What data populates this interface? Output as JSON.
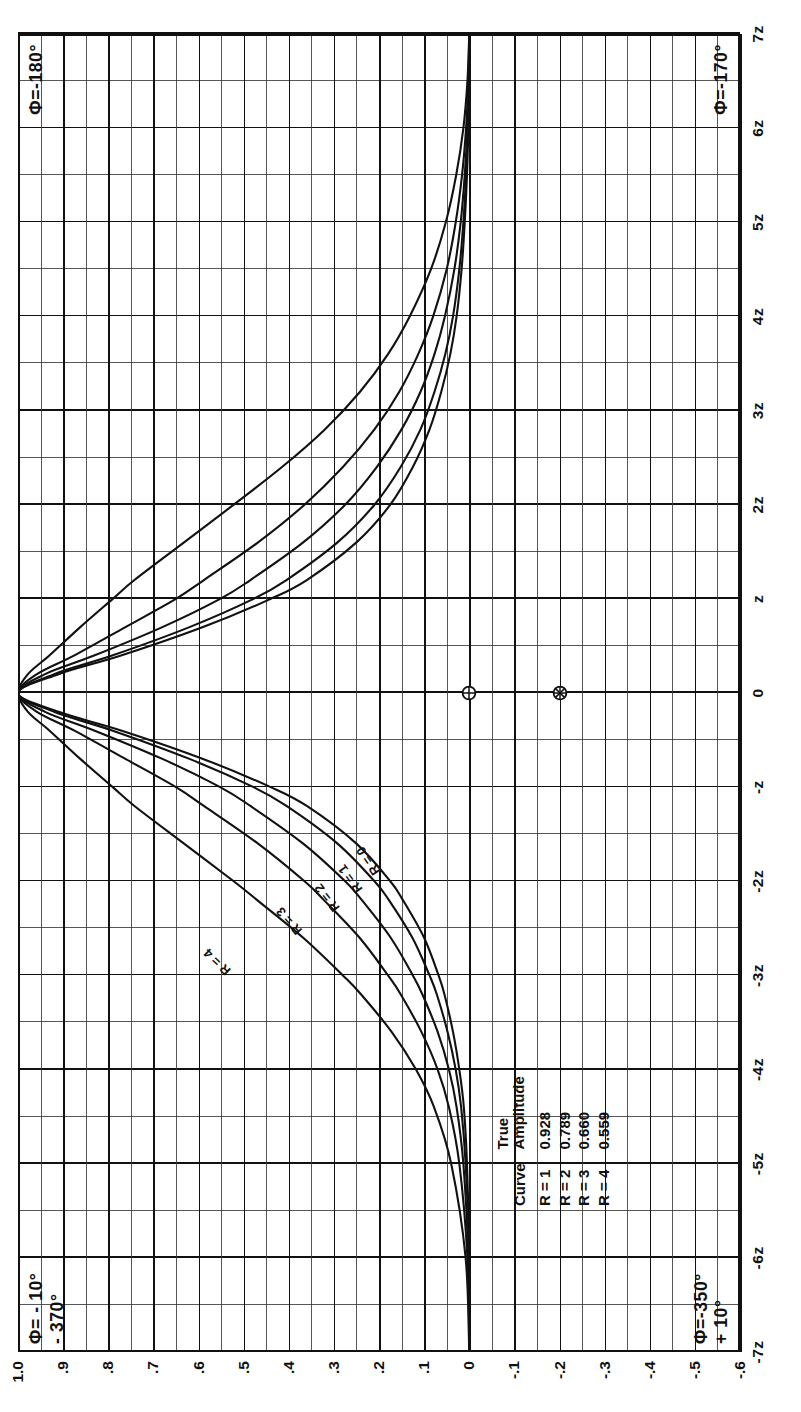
{
  "chart_data": {
    "type": "line",
    "title": "",
    "xlabel": "",
    "ylabel": "",
    "x_tick_labels": [
      "-7z",
      "-6z",
      "-5z",
      "-4z",
      "-3z",
      "-2z",
      "-z",
      "0",
      "z",
      "2z",
      "3z",
      "4z",
      "5z",
      "6z",
      "7z"
    ],
    "x_tick_values": [
      -7,
      -6,
      -5,
      -4,
      -3,
      -2,
      -1,
      0,
      1,
      2,
      3,
      4,
      5,
      6,
      7
    ],
    "y_tick_labels": [
      "1.0",
      ".9",
      ".8",
      ".7",
      ".6",
      ".5",
      ".4",
      ".3",
      ".2",
      ".1",
      "0",
      "-.1",
      "-.2",
      "-.3",
      "-.4",
      "-.5",
      "-.6"
    ],
    "y_tick_values": [
      1.0,
      0.9,
      0.8,
      0.7,
      0.6,
      0.5,
      0.4,
      0.3,
      0.2,
      0.1,
      0.0,
      -0.1,
      -0.2,
      -0.3,
      -0.4,
      -0.5,
      -0.6
    ],
    "xlim": [
      -7,
      7
    ],
    "ylim": [
      -0.6,
      1.0
    ],
    "grid": true,
    "legend_position": "lower-left-inside",
    "series": [
      {
        "name": "R = 0",
        "label": "R = 0",
        "points": [
          [
            -7,
            0.0
          ],
          [
            -6,
            0.0
          ],
          [
            -5,
            0.005
          ],
          [
            -4.4,
            0.012
          ],
          [
            -4,
            0.022
          ],
          [
            -3.6,
            0.036
          ],
          [
            -3.2,
            0.055
          ],
          [
            -3,
            0.068
          ],
          [
            -2.6,
            0.1
          ],
          [
            -2.2,
            0.147
          ],
          [
            -2,
            0.175
          ],
          [
            -1.6,
            0.25
          ],
          [
            -1.2,
            0.36
          ],
          [
            -1,
            0.44
          ],
          [
            -0.7,
            0.59
          ],
          [
            -0.4,
            0.77
          ],
          [
            -0.2,
            0.91
          ],
          [
            0,
            1.0
          ],
          [
            0.2,
            0.91
          ],
          [
            0.4,
            0.77
          ],
          [
            0.7,
            0.59
          ],
          [
            1,
            0.44
          ],
          [
            1.2,
            0.36
          ],
          [
            1.6,
            0.25
          ],
          [
            2,
            0.175
          ],
          [
            2.4,
            0.125
          ],
          [
            2.8,
            0.088
          ],
          [
            3.2,
            0.062
          ],
          [
            3.6,
            0.042
          ],
          [
            4,
            0.028
          ],
          [
            4.5,
            0.017
          ],
          [
            5,
            0.01
          ],
          [
            5.5,
            0.005
          ],
          [
            6,
            0.002
          ],
          [
            6.5,
            0.0
          ],
          [
            7,
            0.0
          ]
        ]
      },
      {
        "name": "R = 1",
        "label": "R = 1",
        "points": [
          [
            -7,
            0.0
          ],
          [
            -6,
            0.0
          ],
          [
            -5,
            0.008
          ],
          [
            -4.4,
            0.018
          ],
          [
            -4,
            0.03
          ],
          [
            -3.6,
            0.048
          ],
          [
            -3.2,
            0.072
          ],
          [
            -3,
            0.088
          ],
          [
            -2.6,
            0.126
          ],
          [
            -2.2,
            0.178
          ],
          [
            -2,
            0.21
          ],
          [
            -1.6,
            0.292
          ],
          [
            -1.2,
            0.405
          ],
          [
            -1,
            0.478
          ],
          [
            -0.7,
            0.62
          ],
          [
            -0.4,
            0.79
          ],
          [
            -0.2,
            0.92
          ],
          [
            0,
            1.0
          ],
          [
            0.2,
            0.92
          ],
          [
            0.4,
            0.79
          ],
          [
            0.7,
            0.62
          ],
          [
            1,
            0.478
          ],
          [
            1.2,
            0.405
          ],
          [
            1.6,
            0.292
          ],
          [
            2,
            0.21
          ],
          [
            2.4,
            0.152
          ],
          [
            2.8,
            0.108
          ],
          [
            3.2,
            0.077
          ],
          [
            3.6,
            0.053
          ],
          [
            4,
            0.036
          ],
          [
            4.5,
            0.022
          ],
          [
            5,
            0.013
          ],
          [
            5.5,
            0.007
          ],
          [
            6,
            0.003
          ],
          [
            6.5,
            0.0
          ],
          [
            7,
            0.0
          ]
        ]
      },
      {
        "name": "R = 2",
        "label": "R = 2",
        "points": [
          [
            -7,
            0.0
          ],
          [
            -6,
            0.002
          ],
          [
            -5,
            0.013
          ],
          [
            -4.4,
            0.028
          ],
          [
            -4,
            0.045
          ],
          [
            -3.6,
            0.07
          ],
          [
            -3.2,
            0.104
          ],
          [
            -3,
            0.125
          ],
          [
            -2.6,
            0.174
          ],
          [
            -2.2,
            0.238
          ],
          [
            -2,
            0.275
          ],
          [
            -1.6,
            0.368
          ],
          [
            -1.2,
            0.485
          ],
          [
            -1,
            0.552
          ],
          [
            -0.7,
            0.68
          ],
          [
            -0.4,
            0.83
          ],
          [
            -0.2,
            0.94
          ],
          [
            0,
            1.0
          ],
          [
            0.2,
            0.94
          ],
          [
            0.4,
            0.83
          ],
          [
            0.7,
            0.68
          ],
          [
            1,
            0.552
          ],
          [
            1.2,
            0.485
          ],
          [
            1.6,
            0.368
          ],
          [
            2,
            0.275
          ],
          [
            2.4,
            0.205
          ],
          [
            2.8,
            0.15
          ],
          [
            3.2,
            0.108
          ],
          [
            3.6,
            0.077
          ],
          [
            4,
            0.054
          ],
          [
            4.5,
            0.033
          ],
          [
            5,
            0.019
          ],
          [
            5.5,
            0.01
          ],
          [
            6,
            0.004
          ],
          [
            6.5,
            0.001
          ],
          [
            7,
            0.0
          ]
        ]
      },
      {
        "name": "R = 3",
        "label": "R = 3",
        "points": [
          [
            -7,
            0.0
          ],
          [
            -6,
            0.004
          ],
          [
            -5,
            0.022
          ],
          [
            -4.4,
            0.045
          ],
          [
            -4,
            0.07
          ],
          [
            -3.6,
            0.106
          ],
          [
            -3.2,
            0.152
          ],
          [
            -3,
            0.18
          ],
          [
            -2.6,
            0.243
          ],
          [
            -2.2,
            0.322
          ],
          [
            -2,
            0.365
          ],
          [
            -1.6,
            0.468
          ],
          [
            -1.2,
            0.588
          ],
          [
            -1,
            0.65
          ],
          [
            -0.7,
            0.762
          ],
          [
            -0.4,
            0.875
          ],
          [
            -0.2,
            0.958
          ],
          [
            0,
            1.0
          ],
          [
            0.2,
            0.958
          ],
          [
            0.4,
            0.875
          ],
          [
            0.7,
            0.762
          ],
          [
            1,
            0.65
          ],
          [
            1.2,
            0.588
          ],
          [
            1.6,
            0.468
          ],
          [
            2,
            0.365
          ],
          [
            2.4,
            0.28
          ],
          [
            2.8,
            0.21
          ],
          [
            3.2,
            0.155
          ],
          [
            3.6,
            0.113
          ],
          [
            4,
            0.08
          ],
          [
            4.5,
            0.05
          ],
          [
            5,
            0.03
          ],
          [
            5.5,
            0.016
          ],
          [
            6,
            0.007
          ],
          [
            6.5,
            0.002
          ],
          [
            7,
            0.0
          ]
        ]
      },
      {
        "name": "R = 4",
        "label": "R = 4",
        "points": [
          [
            -7,
            0.0
          ],
          [
            -6,
            0.008
          ],
          [
            -5,
            0.04
          ],
          [
            -4.4,
            0.078
          ],
          [
            -4,
            0.118
          ],
          [
            -3.6,
            0.172
          ],
          [
            -3.2,
            0.24
          ],
          [
            -3,
            0.28
          ],
          [
            -2.6,
            0.368
          ],
          [
            -2.2,
            0.47
          ],
          [
            -2,
            0.522
          ],
          [
            -1.6,
            0.632
          ],
          [
            -1.2,
            0.742
          ],
          [
            -1,
            0.79
          ],
          [
            -0.7,
            0.862
          ],
          [
            -0.4,
            0.93
          ],
          [
            -0.2,
            0.978
          ],
          [
            0,
            1.0
          ],
          [
            0.2,
            0.978
          ],
          [
            0.4,
            0.93
          ],
          [
            0.7,
            0.862
          ],
          [
            1,
            0.79
          ],
          [
            1.2,
            0.742
          ],
          [
            1.6,
            0.632
          ],
          [
            2,
            0.522
          ],
          [
            2.4,
            0.415
          ],
          [
            2.8,
            0.32
          ],
          [
            3.2,
            0.242
          ],
          [
            3.6,
            0.18
          ],
          [
            4,
            0.132
          ],
          [
            4.5,
            0.085
          ],
          [
            5,
            0.052
          ],
          [
            5.5,
            0.029
          ],
          [
            6,
            0.013
          ],
          [
            6.5,
            0.004
          ],
          [
            7,
            0.0
          ]
        ]
      }
    ],
    "markers": [
      {
        "name": "circle-plus-marker",
        "symbol": "circle-plus",
        "x": 0,
        "y": 0.0
      },
      {
        "name": "circle-asterisk-marker",
        "symbol": "circle-asterisk",
        "x": 0,
        "y": -0.2
      }
    ],
    "annotations": {
      "top_left_line1": "Φ= - 10°",
      "top_left_line2": "- 370°",
      "top_right": "Φ=-180°",
      "bottom_left_line1": "Φ=-350°",
      "bottom_left_line2": "+ 10°",
      "bottom_right": "Φ=-170°"
    },
    "legend_table": {
      "header_curve": "Curve",
      "header_amplitude_line1": "True",
      "header_amplitude_line2": "Amplitude",
      "rows": [
        {
          "curve": "R = 1",
          "amplitude": "0.928"
        },
        {
          "curve": "R = 2",
          "amplitude": "0.789"
        },
        {
          "curve": "R = 3",
          "amplitude": "0.660"
        },
        {
          "curve": "R = 4",
          "amplitude": "0.559"
        }
      ]
    }
  },
  "colors": {
    "ink": "#111111",
    "grid_minor": "#3a3a3a",
    "background": "#ffffff"
  }
}
